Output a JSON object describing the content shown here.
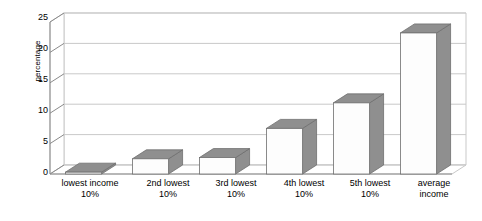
{
  "chart_data": {
    "type": "bar",
    "title": "",
    "subtitle": "",
    "xlabel": "",
    "ylabel": "percentage",
    "ylim": [
      0,
      25
    ],
    "yticks": [
      0,
      5,
      10,
      15,
      20,
      25
    ],
    "ytick_labels": [
      "0",
      "5",
      "10",
      "15",
      "20",
      "25"
    ],
    "grid": true,
    "legend": false,
    "style": "3d-columns",
    "categories": [
      "lowest income 10%",
      "2nd lowest 10%",
      "3rd lowest 10%",
      "4th lowest 10%",
      "5th lowest 10%",
      "average income"
    ],
    "category_lines": [
      [
        "lowest income",
        "10%"
      ],
      [
        "2nd lowest",
        "10%"
      ],
      [
        "3rd lowest",
        "10%"
      ],
      [
        "4th lowest",
        "10%"
      ],
      [
        "5th lowest",
        "10%"
      ],
      [
        "average",
        "income"
      ]
    ],
    "values": [
      0.3,
      2.5,
      2.7,
      7.5,
      11.7,
      23.2
    ],
    "colors": {
      "bar_face": "#fdfdfd",
      "bar_top": "#8f8f8f",
      "bar_side": "#8f8f8f",
      "bar_outline": "#6e6e6e",
      "grid": "#c9c9c9",
      "axis": "#8a8a8a",
      "plot_background": "#ffffff",
      "text": "#000000"
    }
  }
}
